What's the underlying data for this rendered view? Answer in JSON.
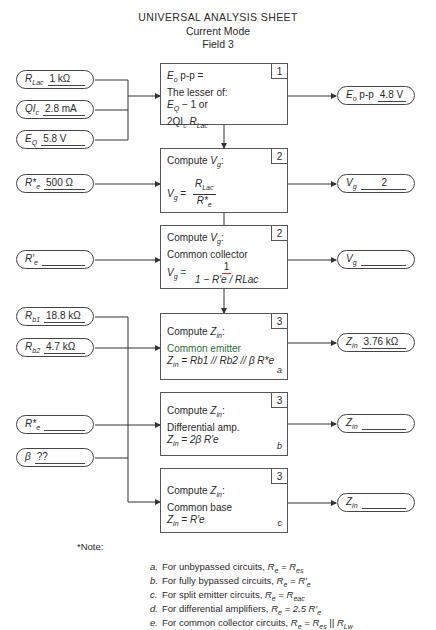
{
  "header": {
    "title": "UNIVERSAL ANALYSIS SHEET",
    "subtitle": "Current Mode",
    "field": "Field 3"
  },
  "inputs": [
    {
      "label": "R",
      "sub": "Lac",
      "value": "1 kΩ"
    },
    {
      "label": "QI",
      "sub": "c",
      "value": "2.8 mA"
    },
    {
      "label": "E",
      "sub": "Q",
      "value": "5.8 V"
    },
    {
      "label": "R*",
      "sub": "e",
      "value": "500 Ω"
    },
    {
      "label": "R′",
      "sub": "e",
      "value": ""
    },
    {
      "label": "R",
      "sub": "b1",
      "value": "18.8 kΩ"
    },
    {
      "label": "R",
      "sub": "b2",
      "value": "4.7 kΩ"
    },
    {
      "label": "R*",
      "sub": "e",
      "value": ""
    },
    {
      "label": "β",
      "sub": "",
      "value": "??"
    }
  ],
  "outputs": [
    {
      "label": "E",
      "sub": "o",
      "suffix": "p-p",
      "value": "4.8 V"
    },
    {
      "label": "V",
      "sub": "g",
      "suffix": "",
      "value": "2"
    },
    {
      "label": "V",
      "sub": "g",
      "suffix": "",
      "value": ""
    },
    {
      "label": "Z",
      "sub": "in",
      "suffix": "",
      "value": "3.76 kΩ"
    },
    {
      "label": "Z",
      "sub": "in",
      "suffix": "",
      "value": ""
    },
    {
      "label": "Z",
      "sub": "in",
      "suffix": "",
      "value": ""
    }
  ],
  "boxes": [
    {
      "num": "1",
      "lines": [
        "p-p =",
        "The lesser of:",
        "− 1 or",
        "2QI"
      ],
      "corner": ""
    },
    {
      "num": "2",
      "heading": "Compute",
      "formula_num": "R",
      "formula_den": "R*",
      "corner": ""
    },
    {
      "num": "2",
      "heading": "Compute",
      "sub_heading": "Common collector",
      "formula_num": "1",
      "formula_den": "1 − R′e / RLac",
      "corner": ""
    },
    {
      "num": "3",
      "heading": "Compute",
      "sub_heading": "Common emitter",
      "formula": "= Rb1 // Rb2 // β R*e",
      "corner": "a"
    },
    {
      "num": "3",
      "heading": "Compute",
      "sub_heading": "Differential amp.",
      "formula": "= 2β R′e",
      "corner": "b"
    },
    {
      "num": "3",
      "heading": "Compute",
      "sub_heading": "Common base",
      "formula": "= R′e",
      "corner": "c"
    }
  ],
  "notes": {
    "heading": "*Note:",
    "items": [
      {
        "letter": "a.",
        "text": "For unbypassed circuits, ",
        "eq": "R",
        "eq_sub": "e",
        "rhs": " = R",
        "rhs_sub": "es",
        "tail": ""
      },
      {
        "letter": "b.",
        "text": "For fully bypassed circuits, ",
        "eq": "R",
        "eq_sub": "e",
        "rhs": " = R′",
        "rhs_sub": "e",
        "tail": ""
      },
      {
        "letter": "c.",
        "text": "For split emitter circuits, ",
        "eq": "R",
        "eq_sub": "e",
        "rhs": " = R",
        "rhs_sub": "eac",
        "tail": ""
      },
      {
        "letter": "d.",
        "text": "For differential amplifiers, ",
        "eq": "R",
        "eq_sub": "e",
        "rhs": " = 2.5 R′",
        "rhs_sub": "e",
        "tail": ""
      },
      {
        "letter": "e.",
        "text": "For common collector circuits, ",
        "eq": "R",
        "eq_sub": "e",
        "rhs": " = R",
        "rhs_sub": "es",
        "tail": " || R",
        "tail_sub": "Lw"
      }
    ]
  },
  "colors": {
    "line": "#333333",
    "accent_red": "#c0392b",
    "accent_green": "#2e8b57"
  }
}
